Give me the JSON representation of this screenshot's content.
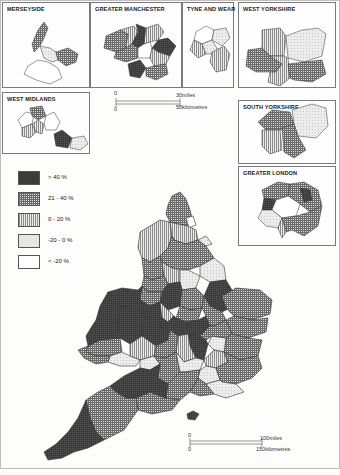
{
  "insets": {
    "merseyside": {
      "title": "MERSEYSIDE"
    },
    "greater_manchester": {
      "title": "GREATER MANCHESTER"
    },
    "tyne_and_wear": {
      "title": "TYNE AND WEAR"
    },
    "west_yorkshire": {
      "title": "WEST YORKSHIRE"
    },
    "west_midlands": {
      "title": "WEST MIDLANDS"
    },
    "south_yorkshire": {
      "title": "SOUTH YORKSHIRE"
    },
    "greater_london": {
      "title": "GREATER LONDON"
    }
  },
  "legend": {
    "items": [
      {
        "label": "> 40 %",
        "pattern": "dark"
      },
      {
        "label": "21 - 40 %",
        "pattern": "grid"
      },
      {
        "label": "0 - 20 %",
        "pattern": "vertical"
      },
      {
        "label": "-20 - 0 %",
        "pattern": "light"
      },
      {
        "label": "< -20 %",
        "pattern": "blank"
      }
    ]
  },
  "inset_scale": {
    "zero_top": "0",
    "miles_label": "30miles",
    "zero_bottom": "0",
    "km_label": "50kilometres"
  },
  "main_scale": {
    "zero_top": "0",
    "miles_label": "100miles",
    "zero_bottom": "0",
    "km_label": "150kilometres"
  },
  "colors": {
    "dark": "#3a3a3a",
    "grid": "#8a8a8a",
    "vertical": "#b8b8b8",
    "light": "#e2e2e2",
    "blank": "#ffffff",
    "outline": "#333333"
  }
}
